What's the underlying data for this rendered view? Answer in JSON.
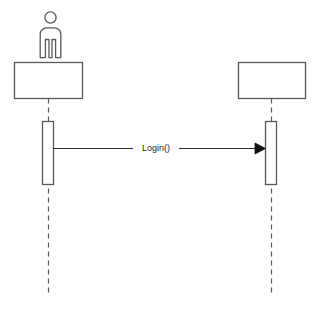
{
  "diagram": {
    "type": "uml-sequence-diagram",
    "canvas": {
      "width": 322,
      "height": 320,
      "background": "#ffffff"
    },
    "stroke_color": "#595959",
    "text_color": "#2b2b2b",
    "participants": [
      {
        "id": "actor",
        "name": "actor-participant",
        "label": "",
        "has_actor_figure": true,
        "box": {
          "x": 14,
          "y": 62,
          "width": 68,
          "height": 36
        },
        "lifeline_x": 48,
        "lifeline_bottom": 295,
        "activation": {
          "x": 42,
          "y": 121,
          "width": 11,
          "height": 63
        }
      },
      {
        "id": "system",
        "name": "system-participant",
        "label": "",
        "has_actor_figure": false,
        "box": {
          "x": 238,
          "y": 62,
          "width": 67,
          "height": 36
        },
        "lifeline_x": 271,
        "lifeline_bottom": 295,
        "activation": {
          "x": 265,
          "y": 121,
          "width": 11,
          "height": 63
        }
      }
    ],
    "messages": [
      {
        "id": "login",
        "label": "Login()",
        "from": "actor",
        "to": "system",
        "y": 148,
        "x_start": 53,
        "x_end": 265,
        "label_x": 156,
        "label_gap_start": 133,
        "label_gap_end": 179,
        "arrow_style": "solid-filled-triangle",
        "line_style": "solid"
      }
    ],
    "actor_figure": {
      "name": "actor-person-icon",
      "head": {
        "cx": 50.5,
        "cy": 17,
        "r": 5.5
      },
      "body": {
        "x": 39,
        "y": 26,
        "width": 23,
        "height": 32
      }
    }
  }
}
